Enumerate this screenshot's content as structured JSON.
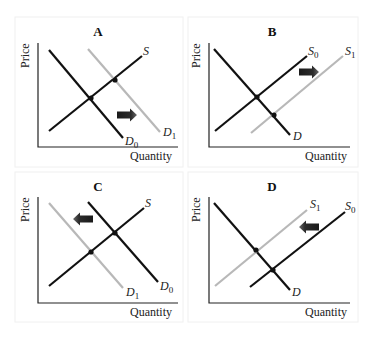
{
  "figure": {
    "top_cropped_text_visible": false,
    "colors": {
      "primary_curve": "#111111",
      "shifted_curve": "#b8b8b8",
      "arrow_dark": "#1a1a1a",
      "arrow_light": "#6a6a6a",
      "axis": "#222222",
      "panel_border": "#f0f0f0"
    },
    "panels": [
      {
        "id": "A",
        "title": "A",
        "description": "Demand increases (shift right)",
        "box": [
          15,
          17,
          168,
          150
        ],
        "axes": {
          "origin": [
            38,
            147
          ],
          "ytop": 43,
          "xright": 178
        },
        "y_label": "Price",
        "x_label": "Quantity",
        "x_label_pos": [
          130,
          160
        ],
        "y_label_pos": [
          29,
          68
        ],
        "curves": [
          {
            "name": "D",
            "sub": "0",
            "from": [
              49,
              50
            ],
            "to": [
              123,
              138
            ],
            "color": "#111111",
            "label_pos": [
              125,
              145
            ]
          },
          {
            "name": "S",
            "sub": "",
            "from": [
              49,
              131
            ],
            "to": [
              142,
              56
            ],
            "color": "#111111",
            "label_pos": [
              143,
              55
            ]
          },
          {
            "name": "D",
            "sub": "1",
            "from": [
              88,
              49
            ],
            "to": [
              160,
              132
            ],
            "color": "#b8b8b8",
            "label_pos": [
              163,
              136
            ]
          }
        ],
        "equilibria": [
          [
            91,
            98
          ],
          [
            115,
            80
          ]
        ],
        "arrow": {
          "x": 117,
          "y": 115,
          "direction": "right",
          "length": 20
        }
      },
      {
        "id": "B",
        "title": "B",
        "description": "Supply increases (shift right)",
        "box": [
          188,
          17,
          170,
          150
        ],
        "axes": {
          "origin": [
            209,
            147
          ],
          "ytop": 43,
          "xright": 350
        },
        "y_label": "Price",
        "x_label": "Quantity",
        "x_label_pos": [
          305,
          160
        ],
        "y_label_pos": [
          200,
          68
        ],
        "curves": [
          {
            "name": "D",
            "sub": "",
            "from": [
              214,
              49
            ],
            "to": [
              290,
              135
            ],
            "color": "#111111",
            "label_pos": [
              293,
              140
            ]
          },
          {
            "name": "S",
            "sub": "0",
            "from": [
              215,
              131
            ],
            "to": [
              307,
              56
            ],
            "color": "#111111",
            "label_pos": [
              308,
              55
            ]
          },
          {
            "name": "S",
            "sub": "1",
            "from": [
              251,
              133
            ],
            "to": [
              343,
              56
            ],
            "color": "#b8b8b8",
            "label_pos": [
              345,
              55
            ]
          }
        ],
        "equilibria": [
          [
            257,
            97
          ],
          [
            274,
            115
          ]
        ],
        "arrow": {
          "x": 299,
          "y": 72,
          "direction": "right",
          "length": 20
        }
      },
      {
        "id": "C",
        "title": "C",
        "description": "Demand decreases (shift left)",
        "box": [
          15,
          172,
          168,
          150
        ],
        "axes": {
          "origin": [
            38,
            303
          ],
          "ytop": 197,
          "xright": 178
        },
        "y_label": "Price",
        "x_label": "Quantity",
        "x_label_pos": [
          130,
          316
        ],
        "y_label_pos": [
          29,
          222
        ],
        "curves": [
          {
            "name": "D",
            "sub": "1",
            "from": [
              49,
              203
            ],
            "to": [
              123,
              288
            ],
            "color": "#b8b8b8",
            "label_pos": [
              126,
              296
            ]
          },
          {
            "name": "D",
            "sub": "0",
            "from": [
              88,
              202
            ],
            "to": [
              158,
              282
            ],
            "color": "#111111",
            "label_pos": [
              160,
              290
            ]
          },
          {
            "name": "S",
            "sub": "",
            "from": [
              49,
              286
            ],
            "to": [
              144,
              208
            ],
            "color": "#111111",
            "label_pos": [
              145,
              207
            ]
          }
        ],
        "equilibria": [
          [
            91,
            252
          ],
          [
            115,
            233
          ]
        ],
        "arrow": {
          "x": 93,
          "y": 219,
          "direction": "left",
          "length": 20
        }
      },
      {
        "id": "D",
        "title": "D",
        "description": "Supply decreases (shift left)",
        "box": [
          188,
          172,
          170,
          150
        ],
        "axes": {
          "origin": [
            209,
            303
          ],
          "ytop": 197,
          "xright": 350
        },
        "y_label": "Price",
        "x_label": "Quantity",
        "x_label_pos": [
          305,
          316
        ],
        "y_label_pos": [
          200,
          222
        ],
        "curves": [
          {
            "name": "D",
            "sub": "",
            "from": [
              214,
              203
            ],
            "to": [
              290,
              290
            ],
            "color": "#111111",
            "label_pos": [
              292,
              296
            ]
          },
          {
            "name": "S",
            "sub": "1",
            "from": [
              215,
              286
            ],
            "to": [
              307,
              210
            ],
            "color": "#b8b8b8",
            "label_pos": [
              310,
              208
            ]
          },
          {
            "name": "S",
            "sub": "0",
            "from": [
              250,
              287
            ],
            "to": [
              345,
              212
            ],
            "color": "#111111",
            "label_pos": [
              345,
              210
            ]
          }
        ],
        "equilibria": [
          [
            256,
            250
          ],
          [
            273,
            270
          ]
        ],
        "arrow": {
          "x": 319,
          "y": 227,
          "direction": "left",
          "length": 20
        }
      }
    ]
  }
}
